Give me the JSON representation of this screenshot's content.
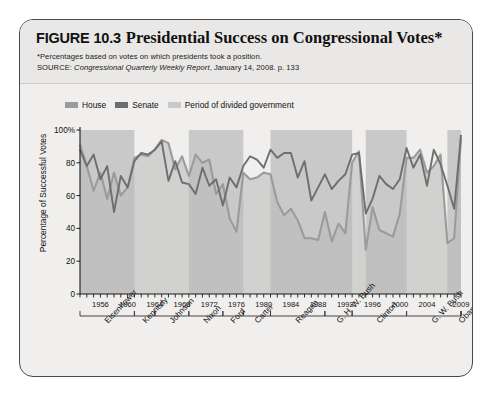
{
  "figure": {
    "label": "FIGURE 10.3",
    "title": "Presidential Success on Congressional Votes*",
    "note": "*Percentages based on votes on which presidents took a position.",
    "source_prefix": "SOURCE: ",
    "source_italic": "Congressional Quarterly Weekly Report",
    "source_suffix": ", January 14, 2008. p. 133"
  },
  "colors": {
    "house": "#9b9b9b",
    "senate": "#6e6e6e",
    "shade": "#c9c9c9",
    "axis": "#1a1a1a",
    "card_bg": "#f0efed",
    "header_bg": "#e9e8e6"
  },
  "legend": {
    "position": "top-left",
    "items": [
      {
        "label": "House",
        "color": "#9b9b9b"
      },
      {
        "label": "Senate",
        "color": "#6e6e6e"
      },
      {
        "label": "Period of divided government",
        "color": "#c9c9c9"
      }
    ]
  },
  "chart_data": {
    "type": "line",
    "title": "Presidential Success on Congressional Votes*",
    "xlabel": "",
    "ylabel": "Percentage of Successful Votes",
    "ylim": [
      0,
      100
    ],
    "yticks": [
      0,
      20,
      40,
      60,
      80,
      100
    ],
    "ytick_labels": [
      "0",
      "20",
      "40",
      "60",
      "80",
      "100%"
    ],
    "grid": false,
    "xlim": [
      1953,
      2009
    ],
    "xticks": [
      1956,
      1960,
      1964,
      1968,
      1972,
      1976,
      1980,
      1984,
      1988,
      1992,
      1996,
      2000,
      2004,
      2009
    ],
    "xtick_labels": [
      "1956",
      "1960",
      "1964",
      "1968",
      "1972",
      "1976",
      "1980",
      "1984",
      "1988",
      "1992",
      "1996",
      "2000",
      "2004",
      "2009"
    ],
    "x": [
      1953,
      1954,
      1955,
      1956,
      1957,
      1958,
      1959,
      1960,
      1961,
      1962,
      1963,
      1964,
      1965,
      1966,
      1967,
      1968,
      1969,
      1970,
      1971,
      1972,
      1973,
      1974,
      1975,
      1976,
      1977,
      1978,
      1979,
      1980,
      1981,
      1982,
      1983,
      1984,
      1985,
      1986,
      1987,
      1988,
      1989,
      1990,
      1991,
      1992,
      1993,
      1994,
      1995,
      1996,
      1997,
      1998,
      1999,
      2000,
      2001,
      2002,
      2003,
      2004,
      2005,
      2006,
      2007,
      2008,
      2009
    ],
    "series": [
      {
        "name": "House",
        "color": "#9b9b9b",
        "values": [
          91,
          78,
          63,
          74,
          58,
          74,
          60,
          65,
          83,
          85,
          84,
          88,
          94,
          92,
          76,
          84,
          72,
          85,
          80,
          82,
          61,
          67,
          46,
          38,
          74,
          70,
          71,
          74,
          73,
          56,
          48,
          52,
          45,
          34,
          34,
          33,
          50,
          32,
          43,
          37,
          80,
          87,
          27,
          53,
          39,
          37,
          35,
          49,
          83,
          83,
          88,
          74,
          78,
          85,
          31,
          34,
          95
        ]
      },
      {
        "name": "Senate",
        "color": "#6e6e6e",
        "values": [
          88,
          78,
          85,
          70,
          78,
          50,
          72,
          65,
          81,
          86,
          85,
          88,
          93,
          69,
          81,
          68,
          67,
          61,
          77,
          66,
          70,
          54,
          71,
          65,
          78,
          84,
          82,
          77,
          88,
          83,
          86,
          86,
          71,
          81,
          57,
          65,
          73,
          64,
          69,
          73,
          85,
          86,
          49,
          58,
          72,
          67,
          64,
          70,
          89,
          77,
          85,
          66,
          88,
          79,
          66,
          52,
          97
        ]
      }
    ],
    "divided_government_periods": [
      {
        "start": 1953,
        "end": 1961
      },
      {
        "start": 1969,
        "end": 1977
      },
      {
        "start": 1981,
        "end": 1993
      },
      {
        "start": 1995,
        "end": 2001
      },
      {
        "start": 2007,
        "end": 2009
      }
    ],
    "presidents": [
      {
        "name": "Eisenhower",
        "start": 1953,
        "end": 1961
      },
      {
        "name": "Kennedy",
        "start": 1961,
        "end": 1964
      },
      {
        "name": "Johnson",
        "start": 1964,
        "end": 1969
      },
      {
        "name": "Nixon",
        "start": 1969,
        "end": 1974
      },
      {
        "name": "Ford",
        "start": 1974,
        "end": 1977
      },
      {
        "name": "Carter",
        "start": 1977,
        "end": 1981
      },
      {
        "name": "Reagan",
        "start": 1981,
        "end": 1989
      },
      {
        "name": "G. H. W. Bush",
        "start": 1989,
        "end": 1993
      },
      {
        "name": "Clinton",
        "start": 1993,
        "end": 2001
      },
      {
        "name": "G. W. Bush",
        "start": 2001,
        "end": 2009
      },
      {
        "name": "Obama",
        "start": 2009,
        "end": 2010
      }
    ]
  }
}
